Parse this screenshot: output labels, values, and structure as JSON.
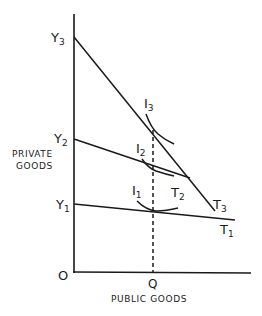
{
  "diagram": {
    "y_axis_label_line1": "PRIVATE",
    "y_axis_label_line2": "GOODS",
    "x_axis_label": "PUBLIC GOODS",
    "origin_label": "O",
    "q_label": "Q",
    "y_intercepts": [
      {
        "letter": "Y",
        "sub": "3"
      },
      {
        "letter": "Y",
        "sub": "2"
      },
      {
        "letter": "Y",
        "sub": "1"
      }
    ],
    "transformation_curves": [
      {
        "letter": "T",
        "sub": "3"
      },
      {
        "letter": "T",
        "sub": "2"
      },
      {
        "letter": "T",
        "sub": "1"
      }
    ],
    "indifference_curves": [
      {
        "letter": "I",
        "sub": "3"
      },
      {
        "letter": "I",
        "sub": "2"
      },
      {
        "letter": "I",
        "sub": "1"
      }
    ],
    "line_color": "#1a1a1a"
  }
}
